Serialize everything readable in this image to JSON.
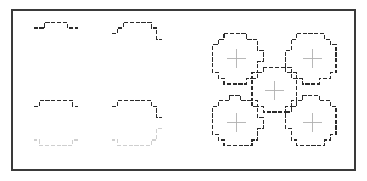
{
  "figure": {
    "background_color": "#ffffff",
    "frame": {
      "name": "figure-frame",
      "x": 12,
      "y": 10,
      "width": 343,
      "height": 160,
      "stroke_color": "#3a3a3a",
      "stroke_width": 1.1
    },
    "colors": {
      "dark_contour": "#2b2b2b",
      "light_contour": "#cfcfcf",
      "cross_mark": "#b0b0b0",
      "frame": "#3a3a3a"
    },
    "style": {
      "grid_step": 5.6,
      "contour_stroke_width": 1.3,
      "dash_pattern": "4.2 1.6",
      "cross_stroke_width": 0.9,
      "cross_arm_length": 9.5
    },
    "panels": [
      {
        "name": "top-left-panel",
        "label": "Upper half contours of two adjacent digitized discs",
        "shapes": [
          {
            "name": "digitized-arc-upper-left",
            "kind": "half-circle-outline-upper",
            "center_x": 56,
            "center_y": 46,
            "radius": 25,
            "contour": "dark",
            "cross": false
          },
          {
            "name": "digitized-arc-upper-right",
            "kind": "half-circle-outline-upper",
            "center_x": 135,
            "center_y": 46,
            "radius": 25,
            "contour": "dark",
            "cross": false
          }
        ]
      },
      {
        "name": "bottom-left-panel",
        "label": "Two adjacent digitized discs, upper half dark and lower half light",
        "shapes": [
          {
            "name": "digitized-disc-lower-left",
            "kind": "full-circle-outline-split",
            "center_x": 56,
            "center_y": 123,
            "radius": 25,
            "contour": "split",
            "cross": false
          },
          {
            "name": "digitized-disc-lower-right",
            "kind": "full-circle-outline-split",
            "center_x": 135,
            "center_y": 123,
            "radius": 25,
            "contour": "split",
            "cross": false
          }
        ]
      },
      {
        "name": "right-panel",
        "label": "Quincunx arrangement of five digitized discs with centre cross marks",
        "shapes": [
          {
            "name": "digitized-disc-top-left",
            "kind": "full-circle-outline",
            "center_x": 236,
            "center_y": 58,
            "radius": 25,
            "contour": "dark",
            "cross": true
          },
          {
            "name": "digitized-disc-top-right",
            "kind": "full-circle-outline",
            "center_x": 312,
            "center_y": 58,
            "radius": 25,
            "contour": "dark",
            "cross": true
          },
          {
            "name": "digitized-disc-centre",
            "kind": "full-circle-outline",
            "center_x": 274,
            "center_y": 90,
            "radius": 22,
            "contour": "dark",
            "cross": true
          },
          {
            "name": "digitized-disc-bottom-left",
            "kind": "full-circle-outline",
            "center_x": 236,
            "center_y": 122,
            "radius": 25,
            "contour": "dark",
            "cross": true
          },
          {
            "name": "digitized-disc-bottom-right",
            "kind": "full-circle-outline",
            "center_x": 312,
            "center_y": 122,
            "radius": 25,
            "contour": "dark",
            "cross": true
          }
        ]
      }
    ]
  }
}
